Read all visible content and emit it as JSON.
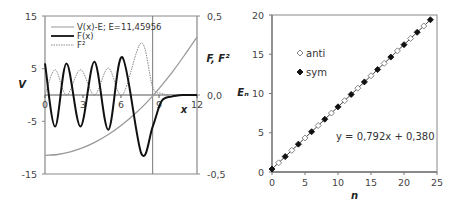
{
  "chart_data": [
    {
      "type": "line",
      "title": "",
      "xlabel": "x",
      "ylabel": "V",
      "y2label": "F, F²",
      "xlim": [
        0,
        12
      ],
      "ylim": [
        -15,
        15
      ],
      "y2lim": [
        -0.5,
        0.5
      ],
      "x_ticks": [
        "0",
        "3",
        "6",
        "9",
        "12"
      ],
      "y_ticks": [
        "15",
        "5",
        "-5",
        "-15"
      ],
      "y2_ticks": [
        "0,5",
        "0,0",
        "-0,5"
      ],
      "grid": false,
      "vertical_marker_x": 8.5,
      "legend_position": "upper-left",
      "series": [
        {
          "name": "V(x)-E; E=11,45956",
          "axis": "left",
          "style": "thin-gray",
          "x": [
            0,
            1,
            2,
            3,
            4,
            5,
            6,
            7,
            8,
            9,
            10,
            11,
            12
          ],
          "y": [
            -11.46,
            -11.3,
            -10.8,
            -10.0,
            -8.9,
            -7.5,
            -5.8,
            -3.8,
            -1.5,
            1.2,
            4.2,
            7.5,
            11.0
          ]
        },
        {
          "name": "F(x)",
          "axis": "right",
          "style": "thick-black",
          "x": [
            0,
            0.8,
            1.7,
            2.8,
            3.9,
            5.0,
            6.1,
            7.6,
            8.5,
            9.2,
            10,
            11,
            12
          ],
          "y": [
            0.2,
            -0.2,
            0.2,
            -0.2,
            0.21,
            -0.22,
            0.24,
            -0.37,
            -0.2,
            -0.04,
            -0.01,
            0.0,
            0.0
          ]
        },
        {
          "name": "F²",
          "axis": "right",
          "style": "dotted-gray",
          "x": [
            0,
            0.8,
            1.7,
            2.8,
            3.9,
            5.0,
            6.1,
            7.6,
            8.5,
            9.2,
            10,
            12
          ],
          "y": [
            0.0,
            0.16,
            0.0,
            0.16,
            0.0,
            0.17,
            0.0,
            0.33,
            0.05,
            0.01,
            0.0,
            0.0
          ]
        }
      ]
    },
    {
      "type": "scatter",
      "title": "",
      "xlabel": "n",
      "ylabel": "Eₙ",
      "xlim": [
        0,
        25
      ],
      "ylim": [
        0,
        20
      ],
      "x_ticks": [
        "0",
        "5",
        "10",
        "15",
        "20",
        "25"
      ],
      "y_ticks": [
        "0",
        "5",
        "10",
        "15",
        "20"
      ],
      "grid": false,
      "legend_position": "upper-left",
      "trendline": {
        "slope": 0.792,
        "intercept": 0.38,
        "label": "y = 0,792x + 0,380"
      },
      "series": [
        {
          "name": "anti",
          "marker": "open-diamond",
          "x": [
            1,
            3,
            5,
            7,
            9,
            11,
            13,
            15,
            17,
            19,
            21,
            23
          ],
          "y": [
            1.17,
            2.76,
            4.34,
            5.92,
            7.51,
            9.09,
            10.68,
            12.26,
            13.84,
            15.43,
            17.01,
            18.6
          ]
        },
        {
          "name": "sym",
          "marker": "filled-diamond",
          "x": [
            0,
            2,
            4,
            6,
            8,
            10,
            12,
            14,
            16,
            18,
            20,
            22,
            24
          ],
          "y": [
            0.38,
            1.96,
            3.55,
            5.13,
            6.72,
            8.3,
            9.88,
            11.47,
            13.05,
            14.64,
            16.22,
            17.8,
            19.39
          ]
        }
      ]
    }
  ],
  "left_chart": {
    "ylabel": "V",
    "y2label": "F, F²",
    "xlabel": "x",
    "legend": [
      "V(x)-E; E=11,45956",
      "F(x)",
      "F²"
    ]
  },
  "right_chart": {
    "ylabel": "Eₙ",
    "xlabel": "n",
    "legend": [
      "anti",
      "sym"
    ],
    "equation": "y = 0,792x + 0,380"
  }
}
